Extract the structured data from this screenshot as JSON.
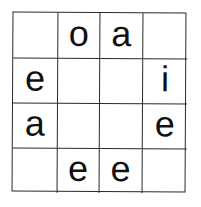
{
  "puzzle": {
    "rows": 4,
    "cols": 4,
    "cells": [
      [
        "",
        "o",
        "a",
        ""
      ],
      [
        "e",
        "",
        "",
        "i"
      ],
      [
        "a",
        "",
        "",
        "e"
      ],
      [
        "",
        "e",
        "e",
        ""
      ]
    ]
  }
}
